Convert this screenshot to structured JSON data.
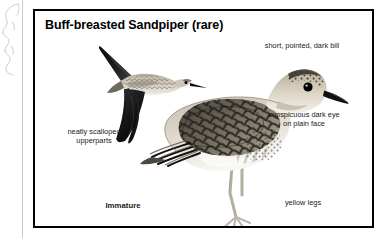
{
  "plate": {
    "title": "Buff-breasted Sandpiper (rare)",
    "frame_color": "#000000",
    "background_color": "#ffffff",
    "text_color": "#1a1a1a"
  },
  "labels": {
    "bill": "short, pointed, dark bill",
    "eye": "conspicuous dark eye\non plain face",
    "legs": "yellow legs",
    "upperparts": "neatly scalloped\nupperparts",
    "age": "Immature"
  },
  "illustrations": [
    {
      "name": "flying-sandpiper",
      "pose": "flight",
      "description": "Buff-breasted Sandpiper in flight, wings raised in a V, showing dark underwing and pale buff body"
    },
    {
      "name": "standing-sandpiper",
      "pose": "standing",
      "description": "Immature Buff-breasted Sandpiper standing, scalloped upperparts, plain buff face with dark eye, short dark bill, yellow legs"
    }
  ],
  "margin": {
    "sketch": "partial line-art bird sketch cropped at page edge",
    "rule": "vertical margin rule"
  },
  "colors": {
    "dark_wing": "#101010",
    "plumage_dark": "#2b2b2b",
    "plumage_mid": "#8a8275",
    "plumage_light": "#ded8cd",
    "belly": "#f3f0ea",
    "leg": "#b8b4a8",
    "bill": "#141414",
    "eye": "#000000"
  }
}
